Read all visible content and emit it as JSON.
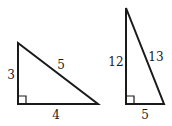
{
  "diagram": {
    "stroke_color": "#1a1a1a",
    "background": "#ffffff",
    "triangles": [
      {
        "name": "triangle-3-4-5",
        "vertices": {
          "top": [
            18,
            43
          ],
          "right_angle": [
            18,
            104
          ],
          "far": [
            98,
            104
          ]
        },
        "right_angle_marker_size": 8,
        "labels": {
          "vertical_leg": {
            "text": "3",
            "x": 11,
            "y": 79
          },
          "horizontal_leg": {
            "text": "4",
            "x": 56,
            "y": 119
          },
          "hypotenuse": {
            "text": "5",
            "x": 61,
            "y": 69
          }
        }
      },
      {
        "name": "triangle-5-12-13",
        "vertices": {
          "top": [
            126,
            8
          ],
          "right_angle": [
            126,
            104
          ],
          "far": [
            164,
            104
          ]
        },
        "right_angle_marker_size": 8,
        "labels": {
          "vertical_leg": {
            "text": "12",
            "x": 116,
            "y": 66
          },
          "horizontal_leg": {
            "text": "5",
            "x": 145,
            "y": 119
          },
          "hypotenuse": {
            "text": "13",
            "x": 156,
            "y": 61
          }
        }
      }
    ]
  }
}
